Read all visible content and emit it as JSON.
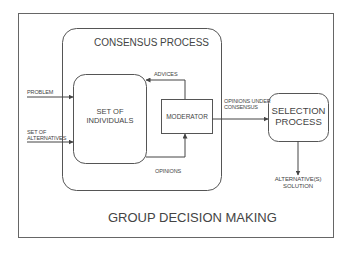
{
  "diagram": {
    "outer_title": "GROUP DECISION MAKING",
    "consensus_title": "CONSENSUS PROCESS",
    "individuals": [
      "SET OF",
      "INDIVIDUALS"
    ],
    "moderator": "MODERATOR",
    "selection": [
      "SELECTION",
      "PROCESS"
    ],
    "inputs": {
      "problem": "PROBLEM",
      "alternatives": [
        "SET OF",
        "ALTERNATIVES"
      ]
    },
    "edges": {
      "advices": "ADVICES",
      "opinions": "OPINIONS",
      "opinions_under_consensus": [
        "OPINIONS UNDER",
        "CONSENSUS"
      ],
      "solution": [
        "ALTERNATIVE(S)",
        "SOLUTION"
      ]
    },
    "colors": {
      "stroke": "#555555",
      "text": "#444444",
      "background": "#ffffff"
    }
  }
}
